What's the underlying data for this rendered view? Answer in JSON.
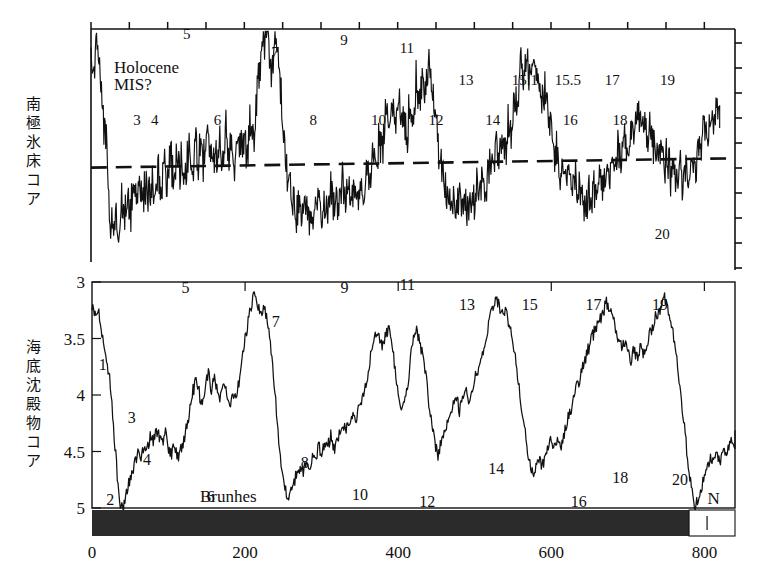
{
  "figure": {
    "panels": [
      {
        "id": "ice-core",
        "ylabel_jp": "南極氷床コア",
        "annotation_line1": "Holocene",
        "annotation_line2": "MIS?"
      },
      {
        "id": "sediment-core",
        "ylabel_jp": "海底沈殿物コア",
        "polarity_label": "Brunhes",
        "polarity_label_right": "N"
      }
    ]
  },
  "chart_data": [
    {
      "type": "line",
      "id": "antarctic-ice-core",
      "title": "南極氷床コア",
      "xlabel": "",
      "ylabel": "南極氷床コア",
      "xlim": [
        0,
        840
      ],
      "ylim": [
        0,
        10
      ],
      "grid": false,
      "legend": "none",
      "axis_notes": "top axis ticks every ~50 ka; right axis unlabeled ticks; dashed horizontal reference line",
      "reference_line": {
        "style": "dashed",
        "y_start": 4.05,
        "y_end": 4.45
      },
      "annotations": [
        {
          "text": "Holocene",
          "x": 30,
          "y": 8.1
        },
        {
          "text": "MIS?",
          "x": 30,
          "y": 7.4
        }
      ],
      "mis_labels": [
        {
          "label": "5",
          "x": 125,
          "y": 9.55
        },
        {
          "label": "3",
          "x": 60,
          "y": 5.9
        },
        {
          "label": "4",
          "x": 83,
          "y": 5.9
        },
        {
          "label": "6",
          "x": 165,
          "y": 5.9
        },
        {
          "label": "7",
          "x": 240,
          "y": 8.8
        },
        {
          "label": "8",
          "x": 290,
          "y": 5.9
        },
        {
          "label": "9",
          "x": 330,
          "y": 9.3
        },
        {
          "label": "10",
          "x": 375,
          "y": 5.9
        },
        {
          "label": "11",
          "x": 412,
          "y": 8.95
        },
        {
          "label": "12",
          "x": 450,
          "y": 5.9
        },
        {
          "label": "13",
          "x": 489,
          "y": 7.6
        },
        {
          "label": "14",
          "x": 524,
          "y": 5.9
        },
        {
          "label": "15.1",
          "x": 566,
          "y": 7.6
        },
        {
          "label": "15.5",
          "x": 622,
          "y": 7.6
        },
        {
          "label": "16",
          "x": 625,
          "y": 5.9
        },
        {
          "label": "17",
          "x": 680,
          "y": 7.6
        },
        {
          "label": "18",
          "x": 690,
          "y": 5.9
        },
        {
          "label": "19",
          "x": 752,
          "y": 7.6
        },
        {
          "label": "20",
          "x": 745,
          "y": 1.0
        }
      ],
      "x": [
        0,
        4,
        8,
        12,
        16,
        20,
        24,
        28,
        32,
        36,
        40,
        44,
        48,
        52,
        56,
        60,
        64,
        68,
        72,
        76,
        80,
        84,
        88,
        92,
        96,
        100,
        104,
        108,
        112,
        116,
        120,
        124,
        128,
        132,
        136,
        140,
        144,
        148,
        152,
        156,
        160,
        164,
        168,
        172,
        176,
        180,
        184,
        188,
        192,
        196,
        200,
        204,
        208,
        212,
        216,
        220,
        224,
        228,
        232,
        236,
        240,
        244,
        248,
        252,
        256,
        260,
        264,
        268,
        272,
        276,
        280,
        284,
        288,
        292,
        296,
        300,
        304,
        308,
        312,
        316,
        320,
        324,
        328,
        332,
        336,
        340,
        344,
        348,
        352,
        356,
        360,
        364,
        368,
        372,
        376,
        380,
        384,
        388,
        392,
        396,
        400,
        404,
        408,
        412,
        416,
        420,
        424,
        428,
        432,
        436,
        440,
        444,
        448,
        452,
        456,
        460,
        464,
        468,
        472,
        476,
        480,
        484,
        488,
        492,
        496,
        500,
        504,
        508,
        512,
        516,
        520,
        524,
        528,
        532,
        536,
        540,
        544,
        548,
        552,
        556,
        560,
        564,
        568,
        572,
        576,
        580,
        584,
        588,
        592,
        596,
        600,
        604,
        608,
        612,
        616,
        620,
        624,
        628,
        632,
        636,
        640,
        644,
        648,
        652,
        656,
        660,
        664,
        668,
        672,
        676,
        680,
        684,
        688,
        692,
        696,
        700,
        704,
        708,
        712,
        716,
        720,
        724,
        728,
        732,
        736,
        740,
        744,
        748,
        752,
        756,
        760,
        764,
        768,
        772,
        776,
        780,
        784,
        788,
        792,
        796,
        800,
        804,
        808,
        812,
        816,
        820
      ],
      "y": [
        9.2,
        8.7,
        9.0,
        8.4,
        6.3,
        5.1,
        2.0,
        1.6,
        2.2,
        1.4,
        2.5,
        1.8,
        2.9,
        2.2,
        3.3,
        2.4,
        3.7,
        2.8,
        3.4,
        2.6,
        3.1,
        2.3,
        3.8,
        3.0,
        4.2,
        3.3,
        4.6,
        3.6,
        4.9,
        4.0,
        4.4,
        3.7,
        4.8,
        4.1,
        5.1,
        4.3,
        4.9,
        4.2,
        5.4,
        4.5,
        4.8,
        4.1,
        5.2,
        4.4,
        5.6,
        4.6,
        5.0,
        4.3,
        5.5,
        4.6,
        5.3,
        4.5,
        6.0,
        5.0,
        7.2,
        8.6,
        9.4,
        9.8,
        9.0,
        8.2,
        9.5,
        8.8,
        7.4,
        5.1,
        3.6,
        3.1,
        2.6,
        2.2,
        2.5,
        2.0,
        2.4,
        1.9,
        2.3,
        2.0,
        2.7,
        2.1,
        2.6,
        2.2,
        3.2,
        2.5,
        3.0,
        2.4,
        3.5,
        2.7,
        3.2,
        2.5,
        3.0,
        2.4,
        3.4,
        2.8,
        4.1,
        3.3,
        4.8,
        4.0,
        5.5,
        4.7,
        6.2,
        5.4,
        6.9,
        6.1,
        7.0,
        6.0,
        6.4,
        5.2,
        6.8,
        5.8,
        7.6,
        6.6,
        8.0,
        7.0,
        8.6,
        7.6,
        7.0,
        5.4,
        4.4,
        3.5,
        2.9,
        2.4,
        2.8,
        2.2,
        2.6,
        2.1,
        2.5,
        2.0,
        3.0,
        2.3,
        3.4,
        2.6,
        3.8,
        3.0,
        4.4,
        3.6,
        5.0,
        4.2,
        5.4,
        4.5,
        6.2,
        5.2,
        7.2,
        6.3,
        8.4,
        7.6,
        8.9,
        8.2,
        9.3,
        8.6,
        8.0,
        6.9,
        7.6,
        6.5,
        5.6,
        4.4,
        4.8,
        3.9,
        4.2,
        3.3,
        3.8,
        3.0,
        3.4,
        2.8,
        3.2,
        2.5,
        3.0,
        2.4,
        3.3,
        2.7,
        3.8,
        3.1,
        4.3,
        3.6,
        4.7,
        4.0,
        5.1,
        4.3,
        5.6,
        4.8,
        6.1,
        5.2,
        6.6,
        5.8,
        6.1,
        5.3,
        5.7,
        4.8,
        5.2,
        4.4,
        4.8,
        4.0,
        4.5,
        3.8,
        4.2,
        3.5,
        4.0,
        3.3,
        4.4,
        3.6,
        4.8,
        4.0,
        5.2,
        4.4,
        5.8,
        5.0,
        6.4,
        5.6,
        7.0,
        6.2,
        6.5,
        5.5,
        5.9,
        4.9,
        5.4,
        4.4,
        5.0,
        4.1,
        4.4,
        3.3,
        3.0,
        2.2,
        2.6,
        1.9,
        2.3,
        1.6,
        2.0,
        1.4,
        1.8,
        1.2
      ]
    },
    {
      "type": "line",
      "id": "deep-sea-sediment-core",
      "title": "海底沈殿物コア",
      "xlabel": "",
      "ylabel": "海底沈殿物コア",
      "xlim": [
        0,
        840
      ],
      "ylim": [
        5,
        3
      ],
      "yticks": [
        "3",
        "3.5",
        "4",
        "4.5",
        "5"
      ],
      "ytickvalues": [
        3,
        3.5,
        4,
        4.5,
        5
      ],
      "y_axis_inverted": true,
      "xticks": [
        "0",
        "200",
        "400",
        "600",
        "800"
      ],
      "xtickvalues": [
        0,
        200,
        400,
        600,
        800
      ],
      "grid": false,
      "legend": "none",
      "polarity_bar": {
        "normal_label": "Brunhes",
        "reversed_label": "N",
        "boundary_ka": 780,
        "bar_color": "#2b2b2b"
      },
      "mis_labels": [
        {
          "label": "1",
          "x": 14,
          "y": 3.78
        },
        {
          "label": "2",
          "x": 24,
          "y": 4.97
        },
        {
          "label": "3",
          "x": 52,
          "y": 4.25
        },
        {
          "label": "4",
          "x": 72,
          "y": 4.62
        },
        {
          "label": "5",
          "x": 122,
          "y": 3.1
        },
        {
          "label": "6",
          "x": 155,
          "y": 4.95
        },
        {
          "label": "7",
          "x": 240,
          "y": 3.4
        },
        {
          "label": "8",
          "x": 278,
          "y": 4.65
        },
        {
          "label": "9",
          "x": 330,
          "y": 3.1
        },
        {
          "label": "10",
          "x": 350,
          "y": 4.93
        },
        {
          "label": "11",
          "x": 412,
          "y": 3.07
        },
        {
          "label": "12",
          "x": 438,
          "y": 4.99
        },
        {
          "label": "13",
          "x": 490,
          "y": 3.25
        },
        {
          "label": "14",
          "x": 528,
          "y": 4.7
        },
        {
          "label": "15",
          "x": 572,
          "y": 3.25
        },
        {
          "label": "16",
          "x": 636,
          "y": 4.99
        },
        {
          "label": "17",
          "x": 655,
          "y": 3.25
        },
        {
          "label": "18",
          "x": 690,
          "y": 4.78
        },
        {
          "label": "19",
          "x": 742,
          "y": 3.25
        },
        {
          "label": "20",
          "x": 768,
          "y": 4.8
        }
      ],
      "x": [
        0,
        4,
        8,
        12,
        16,
        20,
        24,
        28,
        32,
        36,
        40,
        44,
        48,
        52,
        56,
        60,
        64,
        68,
        72,
        76,
        80,
        84,
        88,
        92,
        96,
        100,
        104,
        108,
        112,
        116,
        120,
        124,
        128,
        132,
        136,
        140,
        144,
        148,
        152,
        156,
        160,
        164,
        168,
        172,
        176,
        180,
        184,
        188,
        192,
        196,
        200,
        204,
        208,
        212,
        216,
        220,
        224,
        228,
        232,
        236,
        240,
        244,
        248,
        252,
        256,
        260,
        264,
        268,
        272,
        276,
        280,
        284,
        288,
        292,
        296,
        300,
        304,
        308,
        312,
        316,
        320,
        324,
        328,
        332,
        336,
        340,
        344,
        348,
        352,
        356,
        360,
        364,
        368,
        372,
        376,
        380,
        384,
        388,
        392,
        396,
        400,
        404,
        408,
        412,
        416,
        420,
        424,
        428,
        432,
        436,
        440,
        444,
        448,
        452,
        456,
        460,
        464,
        468,
        472,
        476,
        480,
        484,
        488,
        492,
        496,
        500,
        504,
        508,
        512,
        516,
        520,
        524,
        528,
        532,
        536,
        540,
        544,
        548,
        552,
        556,
        560,
        564,
        568,
        572,
        576,
        580,
        584,
        588,
        592,
        596,
        600,
        604,
        608,
        612,
        616,
        620,
        624,
        628,
        632,
        636,
        640,
        644,
        648,
        652,
        656,
        660,
        664,
        668,
        672,
        676,
        680,
        684,
        688,
        692,
        696,
        700,
        704,
        708,
        712,
        716,
        720,
        724,
        728,
        732,
        736,
        740,
        744,
        748,
        752,
        756,
        760,
        764,
        768,
        772,
        776,
        780,
        784,
        788,
        792,
        796,
        800,
        804,
        808,
        812,
        816,
        820,
        824,
        828,
        832,
        836,
        840
      ],
      "y": [
        3.22,
        3.28,
        3.24,
        3.4,
        3.55,
        3.72,
        3.9,
        4.28,
        4.62,
        4.95,
        5.0,
        4.92,
        4.78,
        4.7,
        4.6,
        4.52,
        4.58,
        4.44,
        4.48,
        4.36,
        4.42,
        4.3,
        4.38,
        4.44,
        4.34,
        4.48,
        4.52,
        4.44,
        4.56,
        4.48,
        4.4,
        4.26,
        4.12,
        3.96,
        3.88,
        3.98,
        4.12,
        3.9,
        3.82,
        3.94,
        3.86,
        3.96,
        4.04,
        3.92,
        4.0,
        4.08,
        3.96,
        4.04,
        3.88,
        3.7,
        3.5,
        3.34,
        3.2,
        3.12,
        3.18,
        3.28,
        3.22,
        3.32,
        3.48,
        3.72,
        4.04,
        4.42,
        4.7,
        4.82,
        4.9,
        4.84,
        4.76,
        4.7,
        4.62,
        4.68,
        4.58,
        4.64,
        4.52,
        4.58,
        4.46,
        4.52,
        4.4,
        4.46,
        4.36,
        4.48,
        4.42,
        4.34,
        4.26,
        4.32,
        4.22,
        4.16,
        4.24,
        4.14,
        4.06,
        3.96,
        3.84,
        3.66,
        3.52,
        3.44,
        3.5,
        3.56,
        3.48,
        3.4,
        3.56,
        3.78,
        3.98,
        4.1,
        4.02,
        3.92,
        3.7,
        3.48,
        3.42,
        3.54,
        3.66,
        3.82,
        4.06,
        4.24,
        4.42,
        4.52,
        4.44,
        4.36,
        4.28,
        4.18,
        4.1,
        4.02,
        4.14,
        4.04,
        3.94,
        4.04,
        3.96,
        3.86,
        3.78,
        3.68,
        3.56,
        3.44,
        3.32,
        3.22,
        3.16,
        3.22,
        3.3,
        3.24,
        3.36,
        3.48,
        3.62,
        3.82,
        4.04,
        4.24,
        4.44,
        4.6,
        4.72,
        4.66,
        4.58,
        4.64,
        4.54,
        4.46,
        4.4,
        4.48,
        4.38,
        4.46,
        4.36,
        4.26,
        4.16,
        4.06,
        3.96,
        3.88,
        3.78,
        3.68,
        3.6,
        3.52,
        3.44,
        3.38,
        3.32,
        3.26,
        3.18,
        3.24,
        3.32,
        3.4,
        3.5,
        3.6,
        3.52,
        3.62,
        3.7,
        3.6,
        3.68,
        3.58,
        3.66,
        3.56,
        3.48,
        3.4,
        3.32,
        3.26,
        3.2,
        3.14,
        3.22,
        3.34,
        3.5,
        3.7,
        3.94,
        4.18,
        4.42,
        4.66,
        4.86,
        4.98,
        4.92,
        4.82,
        4.74,
        4.66,
        4.58,
        4.62,
        4.52,
        4.6,
        4.5,
        4.56,
        4.46,
        4.38,
        4.44,
        4.34,
        4.26,
        4.18,
        4.08,
        3.98,
        3.88,
        3.76,
        3.64,
        3.52,
        3.42,
        3.34,
        3.28,
        3.36,
        3.46,
        3.58,
        3.7,
        3.86,
        4.02,
        4.2,
        4.38,
        4.54,
        4.64,
        4.56,
        4.46,
        4.38,
        4.44,
        4.34,
        4.42,
        4.52,
        4.6,
        4.68,
        4.58,
        4.48,
        4.4,
        4.32,
        4.44,
        4.36,
        4.28,
        4.2,
        4.12,
        4.04,
        3.94,
        3.84,
        3.74,
        3.64,
        3.54,
        3.46,
        3.4,
        3.34,
        3.42,
        3.54,
        3.7,
        3.88,
        4.08,
        4.28,
        4.48,
        4.66,
        4.78,
        4.72,
        4.64,
        4.72,
        4.64,
        4.54,
        4.44,
        4.34,
        4.24,
        4.14,
        4.04,
        3.96,
        3.88,
        3.94,
        3.86,
        3.92,
        3.84,
        3.9,
        3.96,
        3.88,
        3.94,
        3.86
      ]
    }
  ]
}
